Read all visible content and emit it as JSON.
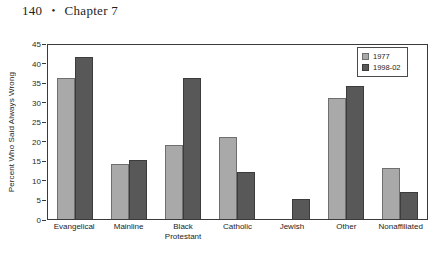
{
  "page_header": {
    "page_number": "140",
    "separator": "•",
    "chapter": "Chapter 7"
  },
  "colors": {
    "series_1977": "#a9a9a9",
    "series_1998_02": "#585858",
    "axis": "#3a3a3a",
    "text": "#1d1d1d",
    "background": "#ffffff"
  },
  "legend": {
    "position": "top-right-inside",
    "entries": [
      {
        "label": "1977",
        "swatch": "light-gray"
      },
      {
        "label": "1998-02",
        "swatch": "dark-gray"
      }
    ]
  },
  "chart_data": {
    "type": "bar",
    "title": "",
    "xlabel": "",
    "ylabel": "Percent Who Said Always Wrong",
    "ylim": [
      0,
      45
    ],
    "yticks": [
      0,
      5,
      10,
      15,
      20,
      25,
      30,
      35,
      40,
      45
    ],
    "ytick_labels": [
      "0",
      "5",
      "10",
      "15",
      "20",
      "25",
      "30",
      "35",
      "40",
      "45"
    ],
    "grid": false,
    "categories": [
      "Evangelical",
      "Mainline",
      "Black\nProtestant",
      "Catholic",
      "Jewish",
      "Other",
      "Nonaffiliated"
    ],
    "series": [
      {
        "name": "1977",
        "values": [
          36,
          14,
          19,
          21,
          0,
          31,
          13
        ]
      },
      {
        "name": "1998-02",
        "values": [
          41.5,
          15,
          36,
          12,
          5,
          34,
          7
        ]
      }
    ]
  }
}
